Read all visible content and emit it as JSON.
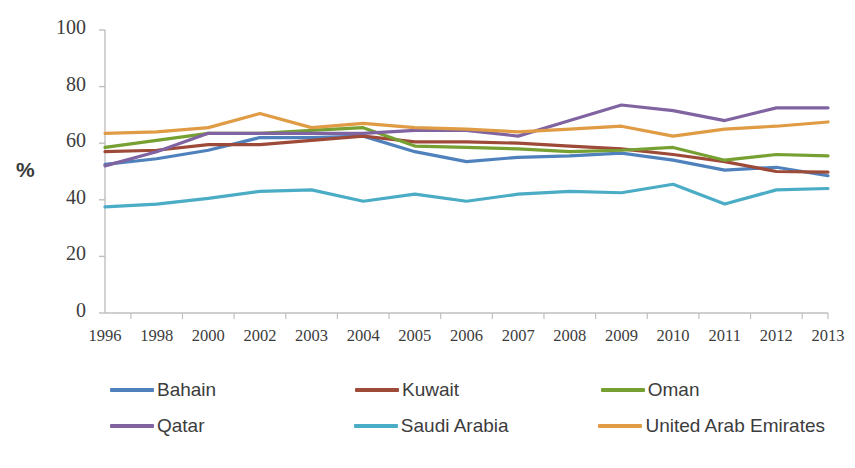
{
  "chart_data": {
    "type": "line",
    "title": "",
    "xlabel": "",
    "ylabel": "%",
    "ylim": [
      0,
      100
    ],
    "ytick_values": [
      0,
      20,
      40,
      60,
      80,
      100
    ],
    "grid": false,
    "legend_position": "bottom",
    "categories": [
      "1996",
      "1998",
      "2000",
      "2002",
      "2003",
      "2004",
      "2005",
      "2006",
      "2007",
      "2008",
      "2009",
      "2010",
      "2011",
      "2012",
      "2013"
    ],
    "series": [
      {
        "name": "Bahain",
        "color": "#4F81BD",
        "values": [
          52.5,
          54.5,
          57.5,
          62.0,
          62.0,
          62.5,
          57.0,
          53.5,
          55.0,
          55.5,
          56.5,
          54.0,
          50.5,
          51.5,
          48.5
        ]
      },
      {
        "name": "Kuwait",
        "color": "#9E4A38",
        "values": [
          57.0,
          57.5,
          59.5,
          59.5,
          61.0,
          62.5,
          60.5,
          60.5,
          60.0,
          59.0,
          58.0,
          56.0,
          53.5,
          50.0,
          49.8
        ]
      },
      {
        "name": "Oman",
        "color": "#77A033",
        "values": [
          58.5,
          61.0,
          63.5,
          63.5,
          64.5,
          65.5,
          59.0,
          58.5,
          58.0,
          57.0,
          57.5,
          58.5,
          54.0,
          56.0,
          55.5
        ]
      },
      {
        "name": "Qatar",
        "color": "#8064A2",
        "values": [
          52.0,
          57.0,
          63.5,
          63.5,
          63.5,
          63.5,
          64.5,
          64.5,
          62.5,
          68.0,
          73.5,
          71.5,
          68.0,
          72.5,
          72.5
        ]
      },
      {
        "name": "Saudi Arabia",
        "color": "#4BACC6",
        "values": [
          37.5,
          38.5,
          40.5,
          43.0,
          43.5,
          39.5,
          42.0,
          39.5,
          42.0,
          43.0,
          42.5,
          45.5,
          38.5,
          43.5,
          44.0
        ]
      },
      {
        "name": "United Arab Emirates",
        "color": "#E09B45",
        "values": [
          63.5,
          64.0,
          65.5,
          70.5,
          65.5,
          67.0,
          65.5,
          65.0,
          64.0,
          65.0,
          66.0,
          62.5,
          65.0,
          66.0,
          67.5
        ]
      }
    ]
  },
  "legend": {
    "rows": [
      [
        {
          "label": "Bahain",
          "color": "#4F81BD",
          "swatch": "line-swatch"
        },
        {
          "label": "Kuwait",
          "color": "#9E4A38",
          "swatch": "line-swatch"
        },
        {
          "label": "Oman",
          "color": "#77A033",
          "swatch": "line-swatch"
        }
      ],
      [
        {
          "label": "Qatar",
          "color": "#8064A2",
          "swatch": "line-swatch"
        },
        {
          "label": "Saudi Arabia",
          "color": "#4BACC6",
          "swatch": "line-swatch"
        },
        {
          "label": "United Arab Emirates",
          "color": "#E09B45",
          "swatch": "line-swatch"
        }
      ]
    ]
  },
  "axes": {
    "y_title": "%",
    "y_ticks": [
      "100",
      "80",
      "60",
      "40",
      "20",
      "0"
    ],
    "x_ticks": [
      "1996",
      "1998",
      "2000",
      "2002",
      "2003",
      "2004",
      "2005",
      "2006",
      "2007",
      "2008",
      "2009",
      "2010",
      "2011",
      "2012",
      "2013"
    ],
    "axis_color": "#BFBFBF"
  }
}
